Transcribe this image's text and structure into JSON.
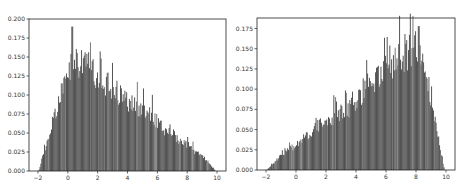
{
  "chart_data": [
    {
      "type": "bar",
      "subtype": "histogram",
      "title": "",
      "xlabel": "",
      "ylabel": "",
      "xlim": [
        -2.6,
        10.6
      ],
      "ylim": [
        0,
        0.2
      ],
      "xticks": [
        -2,
        0,
        2,
        4,
        6,
        8,
        10
      ],
      "xtick_labels": [
        "−2",
        "0",
        "2",
        "4",
        "6",
        "8",
        "10"
      ],
      "yticks": [
        0.0,
        0.025,
        0.05,
        0.075,
        0.1,
        0.125,
        0.15,
        0.175,
        0.2
      ],
      "ytick_labels": [
        "0.000",
        "0.025",
        "0.050",
        "0.075",
        "0.100",
        "0.125",
        "0.150",
        "0.175",
        "0.200"
      ],
      "grid": false,
      "bar_color": "#404040",
      "envelope_x": [
        -1.95,
        -1.5,
        -1.0,
        -0.5,
        0.0,
        0.3,
        0.5,
        1.0,
        1.5,
        2.0,
        2.5,
        3.0,
        3.5,
        4.0,
        4.5,
        5.0,
        5.5,
        6.0,
        6.5,
        7.0,
        7.5,
        8.0,
        8.5,
        9.0,
        9.5,
        9.9
      ],
      "envelope_density": [
        0.0,
        0.03,
        0.065,
        0.1,
        0.13,
        0.15,
        0.145,
        0.14,
        0.135,
        0.125,
        0.115,
        0.11,
        0.1,
        0.09,
        0.085,
        0.08,
        0.075,
        0.065,
        0.055,
        0.05,
        0.04,
        0.035,
        0.025,
        0.02,
        0.01,
        0.0
      ],
      "peak": {
        "x": 0.3,
        "density": 0.19
      }
    },
    {
      "type": "bar",
      "subtype": "histogram",
      "title": "",
      "xlabel": "",
      "ylabel": "",
      "xlim": [
        -2.6,
        10.6
      ],
      "ylim": [
        0,
        0.188
      ],
      "xticks": [
        -2,
        0,
        2,
        4,
        6,
        8,
        10
      ],
      "xtick_labels": [
        "−2",
        "0",
        "2",
        "4",
        "6",
        "8",
        "10"
      ],
      "yticks": [
        0.0,
        0.025,
        0.05,
        0.075,
        0.1,
        0.125,
        0.15,
        0.175
      ],
      "ytick_labels": [
        "0.000",
        "0.025",
        "0.050",
        "0.075",
        "0.100",
        "0.125",
        "0.150",
        "0.175"
      ],
      "grid": false,
      "bar_color": "#404040",
      "envelope_x": [
        -1.95,
        -1.5,
        -1.0,
        -0.5,
        0.0,
        0.5,
        1.0,
        1.5,
        2.0,
        2.5,
        3.0,
        3.5,
        4.0,
        4.5,
        5.0,
        5.5,
        6.0,
        6.5,
        7.0,
        7.5,
        8.0,
        8.3,
        8.7,
        9.0,
        9.3,
        9.6,
        9.9
      ],
      "envelope_density": [
        0.0,
        0.008,
        0.018,
        0.025,
        0.03,
        0.038,
        0.045,
        0.055,
        0.06,
        0.065,
        0.07,
        0.075,
        0.085,
        0.09,
        0.11,
        0.115,
        0.12,
        0.13,
        0.14,
        0.145,
        0.15,
        0.145,
        0.12,
        0.09,
        0.06,
        0.03,
        0.0
      ],
      "peak": {
        "x": 8.2,
        "density": 0.178
      }
    }
  ]
}
